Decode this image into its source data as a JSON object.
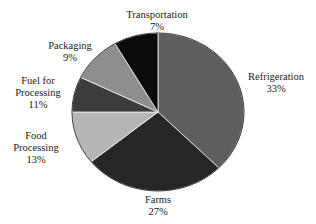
{
  "chart_data": {
    "type": "pie",
    "title": "",
    "categories": [
      "Refrigeration",
      "Farms",
      "Food Processing",
      "Fuel for Processing",
      "Packaging",
      "Transportation"
    ],
    "values": [
      33,
      27,
      13,
      11,
      9,
      7
    ],
    "unit": "%",
    "legend": "none (direct labels)",
    "slices": [
      {
        "label": "Refrigeration",
        "value": 33,
        "pct": "33%",
        "color": "#5e5e5e",
        "start_deg": 0,
        "end_deg": 135
      },
      {
        "label": "Farms",
        "value": 27,
        "pct": "27%",
        "color": "#262626",
        "start_deg": 135,
        "end_deg": 231
      },
      {
        "label": "Food Processing",
        "value": 13,
        "pct": "13%",
        "color": "#b6b6b6",
        "start_deg": 231,
        "end_deg": 270
      },
      {
        "label": "Fuel for Processing",
        "value": 11,
        "pct": "11%",
        "color": "#3c3c3c",
        "start_deg": 270,
        "end_deg": 296
      },
      {
        "label": "Packaging",
        "value": 9,
        "pct": "9%",
        "color": "#8e8e8e",
        "start_deg": 296,
        "end_deg": 330
      },
      {
        "label": "Transportation",
        "value": 7,
        "pct": "7%",
        "color": "#0b0b0b",
        "start_deg": 330,
        "end_deg": 360
      }
    ]
  },
  "labels": {
    "refrigeration": {
      "name": "Refrigeration",
      "pct": "33%"
    },
    "farms": {
      "name": "Farms",
      "pct": "27%"
    },
    "food_processing": {
      "line1": "Food",
      "line2": "Processing",
      "pct": "13%"
    },
    "fuel": {
      "line1": "Fuel for",
      "line2": "Processing",
      "pct": "11%"
    },
    "packaging": {
      "name": "Packaging",
      "pct": "9%"
    },
    "transportation": {
      "name": "Transportation",
      "pct": "7%"
    }
  }
}
